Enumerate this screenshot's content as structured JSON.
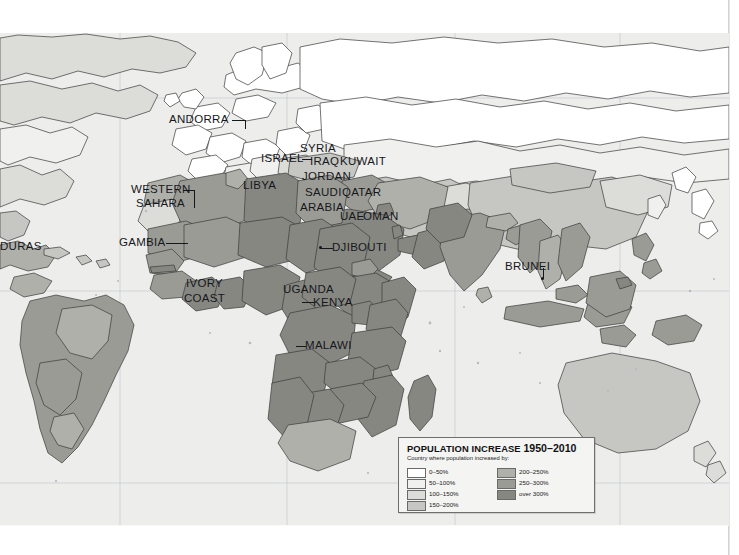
{
  "document": {
    "type": "printed-atlas-page",
    "subject": "World map of population increase 1950-2010"
  },
  "map": {
    "projection_note": "world map, centred on Africa/Eurasia",
    "labels": [
      {
        "name": "honduras-label",
        "text": "DURAS",
        "x": 0,
        "y": 218,
        "leader": "none"
      },
      {
        "name": "andorra-label",
        "text": "ANDORRA",
        "x": 170,
        "y": 113,
        "leader": "right"
      },
      {
        "name": "western-sahara-label",
        "text": "WESTERN",
        "x": 131,
        "y": 183,
        "leader": "none"
      },
      {
        "name": "western-sahara-label2",
        "text": "SAHARA",
        "x": 134,
        "y": 196,
        "leader": "right"
      },
      {
        "name": "gambia-label",
        "text": "GAMBIA",
        "x": 119,
        "y": 236,
        "leader": "right"
      },
      {
        "name": "ivory-coast-label",
        "text": "IVORY",
        "x": 185,
        "y": 278,
        "leader": "none"
      },
      {
        "name": "ivory-coast-label2",
        "text": "COAST",
        "x": 184,
        "y": 293,
        "leader": "none"
      },
      {
        "name": "libya-label",
        "text": "LIBYA",
        "x": 243,
        "y": 180,
        "leader": "none"
      },
      {
        "name": "israel-label",
        "text": "ISRAEL",
        "x": 262,
        "y": 152,
        "leader": "right"
      },
      {
        "name": "syria-label",
        "text": "SYRIA",
        "x": 302,
        "y": 142,
        "leader": "none"
      },
      {
        "name": "iraq-label",
        "text": "IRAQ",
        "x": 311,
        "y": 155,
        "leader": "none"
      },
      {
        "name": "kuwait-label",
        "text": "KUWAIT",
        "x": 341,
        "y": 155,
        "leader": "none"
      },
      {
        "name": "jordan-label",
        "text": "JORDAN",
        "x": 303,
        "y": 171,
        "leader": "none"
      },
      {
        "name": "saudi-label",
        "text": "SAUDI",
        "x": 305,
        "y": 187,
        "leader": "none"
      },
      {
        "name": "qatar-label",
        "text": "QATAR",
        "x": 342,
        "y": 187,
        "leader": "none"
      },
      {
        "name": "arabia-label",
        "text": "ARABIA",
        "x": 300,
        "y": 203,
        "leader": "none"
      },
      {
        "name": "uae-label",
        "text": "UAE",
        "x": 341,
        "y": 211,
        "leader": "none"
      },
      {
        "name": "oman-label",
        "text": "OMAN",
        "x": 363,
        "y": 211,
        "leader": "none"
      },
      {
        "name": "djibouti-label",
        "text": "DJIBOUTI",
        "x": 330,
        "y": 241,
        "leader": "left"
      },
      {
        "name": "uganda-label",
        "text": "UGANDA",
        "x": 284,
        "y": 284,
        "leader": "none"
      },
      {
        "name": "kenya-label",
        "text": "KENYA",
        "x": 313,
        "y": 296,
        "leader": "left"
      },
      {
        "name": "malawi-label",
        "text": "MALAWI",
        "x": 305,
        "y": 340,
        "leader": "left"
      },
      {
        "name": "brunei-label",
        "text": "BRUNEI",
        "x": 505,
        "y": 261,
        "leader": "downleft"
      }
    ]
  },
  "legend": {
    "name": "population-increase-legend",
    "title_main": "POPULATION INCREASE ",
    "title_years": "1950–2010",
    "subtitle": "Country where population increased by:",
    "entries_left": [
      {
        "label": "0–50%",
        "color": "#ffffff"
      },
      {
        "label": "50–100%",
        "color": "#f0f0ee"
      },
      {
        "label": "100–150%",
        "color": "#dcdcd8"
      },
      {
        "label": "150–200%",
        "color": "#c6c6c2"
      }
    ],
    "entries_right": [
      {
        "label": "200–250%",
        "color": "#b0b0ab"
      },
      {
        "label": "250–300%",
        "color": "#9b9b96"
      },
      {
        "label": "over 300%",
        "color": "#878782"
      }
    ]
  },
  "palette": {
    "paper": "#f2f2f1",
    "ocean": "#ededec",
    "outline": "#3a3a3a",
    "graticule": "#c8cdd2",
    "band_0_50": "#ffffff",
    "band_50_100": "#f0f0ee",
    "band_100_150": "#dcdcd8",
    "band_150_200": "#c6c6c2",
    "band_200_250": "#b0b0ab",
    "band_250_300": "#9b9b96",
    "band_over_300": "#878782"
  }
}
